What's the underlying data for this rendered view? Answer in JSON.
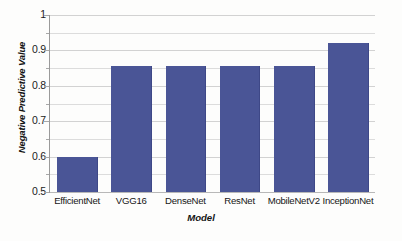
{
  "chart_data": {
    "type": "bar",
    "title": "",
    "xlabel": "Model",
    "ylabel": "Negative Predictive Value",
    "categories": [
      "EfficientNet",
      "VGG16",
      "DenseNet",
      "ResNet",
      "MobileNetV2",
      "InceptionNet"
    ],
    "values": [
      0.6,
      0.855,
      0.855,
      0.855,
      0.855,
      0.92
    ],
    "ylim": [
      0.5,
      1.0
    ],
    "y_major_ticks": [
      0.5,
      0.6,
      0.7,
      0.8,
      0.9,
      1
    ],
    "y_major_tick_labels": [
      "0.5",
      "0.6",
      "0.7",
      "0.8",
      "0.9",
      "1"
    ],
    "y_minor_ticks": [
      0.55,
      0.65,
      0.75,
      0.85,
      0.95
    ],
    "grid": true,
    "grid_axis": "y",
    "legend": false,
    "bar_color": "#4A5596",
    "gridline_color": "#DCDCDC",
    "background_color": "#FDFDFC"
  }
}
